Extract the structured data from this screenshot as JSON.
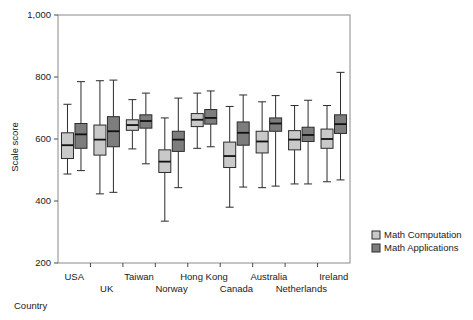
{
  "chart_data": {
    "type": "box",
    "title": "",
    "xlabel": "Country",
    "ylabel": "Scale score",
    "ylim": [
      200,
      1000
    ],
    "yticks": [
      200,
      400,
      600,
      800,
      1000
    ],
    "ytick_labels": [
      "200",
      "400",
      "600",
      "800",
      "1,000"
    ],
    "grid": false,
    "legend_position": "right",
    "categories": [
      "USA",
      "UK",
      "Taiwan",
      "Norway",
      "Hong Kong",
      "Canada",
      "Australia",
      "Netherlands",
      "Ireland"
    ],
    "series": [
      {
        "name": "Math Computation",
        "color": "#c9c9c9",
        "boxes": [
          {
            "category": "USA",
            "whisker_low": 487,
            "q1": 537,
            "median": 580,
            "q3": 620,
            "whisker_high": 712
          },
          {
            "category": "UK",
            "whisker_low": 423,
            "q1": 548,
            "median": 598,
            "q3": 645,
            "whisker_high": 788
          },
          {
            "category": "Taiwan",
            "whisker_low": 568,
            "q1": 628,
            "median": 645,
            "q3": 662,
            "whisker_high": 727
          },
          {
            "category": "Norway",
            "whisker_low": 335,
            "q1": 492,
            "median": 527,
            "q3": 565,
            "whisker_high": 668
          },
          {
            "category": "Hong Kong",
            "whisker_low": 570,
            "q1": 640,
            "median": 662,
            "q3": 682,
            "whisker_high": 748
          },
          {
            "category": "Canada",
            "whisker_low": 380,
            "q1": 508,
            "median": 545,
            "q3": 590,
            "whisker_high": 705
          },
          {
            "category": "Australia",
            "whisker_low": 443,
            "q1": 555,
            "median": 592,
            "q3": 625,
            "whisker_high": 720
          },
          {
            "category": "Netherlands",
            "whisker_low": 455,
            "q1": 565,
            "median": 598,
            "q3": 627,
            "whisker_high": 708
          },
          {
            "category": "Ireland",
            "whisker_low": 462,
            "q1": 570,
            "median": 600,
            "q3": 632,
            "whisker_high": 708
          }
        ]
      },
      {
        "name": "Math Applications",
        "color": "#7d7d7d",
        "boxes": [
          {
            "category": "USA",
            "whisker_low": 498,
            "q1": 570,
            "median": 615,
            "q3": 650,
            "whisker_high": 785
          },
          {
            "category": "UK",
            "whisker_low": 428,
            "q1": 575,
            "median": 625,
            "q3": 672,
            "whisker_high": 790
          },
          {
            "category": "Taiwan",
            "whisker_low": 520,
            "q1": 635,
            "median": 658,
            "q3": 678,
            "whisker_high": 748
          },
          {
            "category": "Norway",
            "whisker_low": 443,
            "q1": 560,
            "median": 598,
            "q3": 625,
            "whisker_high": 732
          },
          {
            "category": "Hong Kong",
            "whisker_low": 575,
            "q1": 648,
            "median": 668,
            "q3": 695,
            "whisker_high": 755
          },
          {
            "category": "Canada",
            "whisker_low": 445,
            "q1": 580,
            "median": 620,
            "q3": 655,
            "whisker_high": 742
          },
          {
            "category": "Australia",
            "whisker_low": 448,
            "q1": 625,
            "median": 650,
            "q3": 668,
            "whisker_high": 740
          },
          {
            "category": "Netherlands",
            "whisker_low": 455,
            "q1": 592,
            "median": 613,
            "q3": 638,
            "whisker_high": 725
          },
          {
            "category": "Ireland",
            "whisker_low": 468,
            "q1": 618,
            "median": 648,
            "q3": 678,
            "whisker_high": 815
          }
        ]
      }
    ]
  },
  "axes": {
    "y_title": "Scale score",
    "x_title": "Country"
  },
  "legend": {
    "items": [
      {
        "label": "Math Computation",
        "color": "#c9c9c9"
      },
      {
        "label": "Math Applications",
        "color": "#7d7d7d"
      }
    ]
  }
}
